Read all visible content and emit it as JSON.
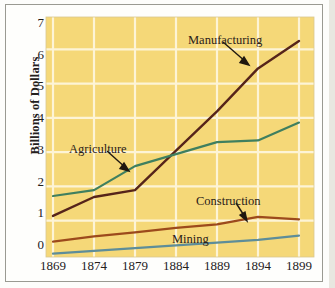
{
  "chart_data": {
    "type": "line",
    "title": "",
    "subtitle": "",
    "xlabel": "",
    "ylabel": "Billions of Dollars",
    "x": [
      1869,
      1874,
      1879,
      1884,
      1889,
      1894,
      1899
    ],
    "categories": [
      "1869",
      "1874",
      "1879",
      "1884",
      "1889",
      "1894",
      "1899"
    ],
    "xlim": [
      1869,
      1899
    ],
    "ylim": [
      0,
      7
    ],
    "ytick_labels": [
      "0",
      "1",
      "2",
      "3",
      "4",
      "5",
      "6",
      "7"
    ],
    "ytick_values": [
      0,
      1,
      2,
      3,
      4,
      5,
      6,
      7
    ],
    "grid": true,
    "grid_color": "#fdf5da",
    "plot_background": "#f5d878",
    "legend_position": "inline-annotations",
    "series": [
      {
        "name": "Manufacturing",
        "color": "#56241a",
        "values": [
          1.2,
          1.75,
          1.95,
          3.1,
          4.25,
          5.5,
          6.3
        ]
      },
      {
        "name": "Agriculture",
        "color": "#3f7f5f",
        "values": [
          1.78,
          1.95,
          2.65,
          3.0,
          3.35,
          3.4,
          3.92
        ]
      },
      {
        "name": "Construction",
        "color": "#9c4a1c",
        "values": [
          0.45,
          0.6,
          0.72,
          0.85,
          0.95,
          1.17,
          1.1
        ]
      },
      {
        "name": "Mining",
        "color": "#5e8d99",
        "values": [
          0.1,
          0.18,
          0.26,
          0.34,
          0.42,
          0.5,
          0.62
        ]
      }
    ],
    "annotations": [
      {
        "label": "Manufacturing",
        "target_x": 1894,
        "target_y": 5.5,
        "has_arrow": true
      },
      {
        "label": "Agriculture",
        "target_x": 1879,
        "target_y": 2.65,
        "has_arrow": true
      },
      {
        "label": "Construction",
        "target_x": 1891,
        "target_y": 1.02,
        "has_arrow": true
      },
      {
        "label": "Mining",
        "target_x": 1886,
        "target_y": 0.55,
        "has_arrow": false
      }
    ]
  }
}
